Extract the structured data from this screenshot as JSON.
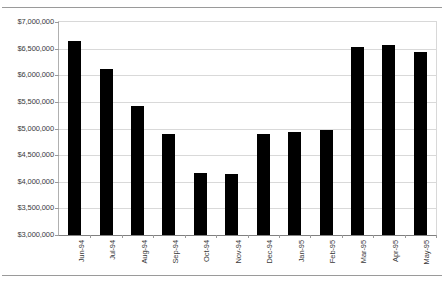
{
  "chart_data": {
    "type": "bar",
    "title": "",
    "xlabel": "",
    "ylabel": "",
    "categories": [
      "Jun-94",
      "Jul-94",
      "Aug-94",
      "Sep-94",
      "Oct-94",
      "Nov-94",
      "Dec-94",
      "Jan-95",
      "Feb-95",
      "Mar-95",
      "Apr-95",
      "May-95"
    ],
    "values": [
      6640000,
      6120000,
      5420000,
      4890000,
      4160000,
      4155000,
      4890000,
      4940000,
      4980000,
      6530000,
      6570000,
      6440000
    ],
    "ylim": [
      3000000,
      7000000
    ],
    "ytick_values": [
      3000000,
      3500000,
      4000000,
      4500000,
      5000000,
      5500000,
      6000000,
      6500000,
      7000000
    ],
    "ytick_labels": [
      "$3,000,000",
      "$3,500,000",
      "$4,000,000",
      "$4,500,000",
      "$5,000,000",
      "$5,500,000",
      "$6,000,000",
      "$6,500,000",
      "$7,000,000"
    ],
    "grid": true,
    "legend": false,
    "bar_color": "#000000",
    "grid_color": "#d9d9d9",
    "axis_color": "#808080",
    "text_color": "#3a3a3a"
  }
}
